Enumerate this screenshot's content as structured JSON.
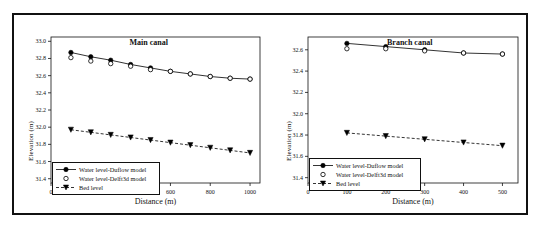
{
  "figure": {
    "background": "#ffffff",
    "border_color": "#111111",
    "axis_color": "#111111",
    "series_color": "#000000"
  },
  "chart_data": [
    {
      "type": "line",
      "title": "Main canal",
      "xlabel": "Distance (m)",
      "ylabel": "Elevation (m)",
      "xlim": [
        0,
        1050
      ],
      "ylim": [
        31.35,
        33.05
      ],
      "xticks": [
        0,
        200,
        400,
        600,
        800,
        1000
      ],
      "xtick_labels": [
        "0",
        "200",
        "400",
        "600",
        "800",
        "1000"
      ],
      "yticks": [
        31.4,
        31.6,
        31.8,
        32.0,
        32.2,
        32.4,
        32.6,
        32.8,
        33.0
      ],
      "ytick_labels": [
        "31.4",
        "31.6",
        "31.8",
        "32.0",
        "32.2",
        "32.4",
        "32.6",
        "32.8",
        "33.0"
      ],
      "grid": false,
      "legend_position": "lower-left",
      "x": [
        100,
        200,
        300,
        400,
        500,
        600,
        700,
        800,
        900,
        1000
      ],
      "series": [
        {
          "name": "Water level-Duflow model",
          "marker": "filled-circle",
          "line": "solid",
          "values": [
            32.87,
            32.82,
            32.78,
            32.73,
            32.69,
            32.65,
            32.62,
            32.59,
            32.57,
            32.56
          ]
        },
        {
          "name": "Water level-Delft3d model",
          "marker": "open-circle",
          "line": "none",
          "values": [
            32.81,
            32.77,
            32.74,
            32.71,
            32.67,
            32.65,
            32.62,
            32.59,
            32.57,
            32.56
          ]
        },
        {
          "name": "Bed level",
          "marker": "filled-triangle-down",
          "line": "dashed",
          "values": [
            31.97,
            31.94,
            31.91,
            31.88,
            31.85,
            31.82,
            31.79,
            31.76,
            31.73,
            31.7
          ]
        }
      ]
    },
    {
      "type": "line",
      "title": "Branch canal",
      "xlabel": "Distance (m)",
      "ylabel": "Elevation (m)",
      "xlim": [
        0,
        540
      ],
      "ylim": [
        31.35,
        32.72
      ],
      "xticks": [
        0,
        100,
        200,
        300,
        400,
        500
      ],
      "xtick_labels": [
        "0",
        "100",
        "200",
        "300",
        "400",
        "500"
      ],
      "yticks": [
        31.4,
        31.6,
        31.8,
        32.0,
        32.2,
        32.4,
        32.6
      ],
      "ytick_labels": [
        "31.4",
        "31.6",
        "31.8",
        "32.0",
        "32.2",
        "32.4",
        "32.6"
      ],
      "grid": false,
      "legend_position": "lower-left",
      "x": [
        100,
        200,
        300,
        400,
        500
      ],
      "series": [
        {
          "name": "Water level-Duflow model",
          "marker": "filled-circle",
          "line": "solid",
          "values": [
            32.66,
            32.63,
            32.6,
            32.57,
            32.56
          ]
        },
        {
          "name": "Water level-Delft3d model",
          "marker": "open-circle",
          "line": "none",
          "values": [
            32.61,
            32.61,
            32.59,
            32.57,
            32.56
          ]
        },
        {
          "name": "Bed level",
          "marker": "filled-triangle-down",
          "line": "dashed",
          "values": [
            31.82,
            31.79,
            31.76,
            31.73,
            31.7
          ]
        }
      ]
    }
  ]
}
